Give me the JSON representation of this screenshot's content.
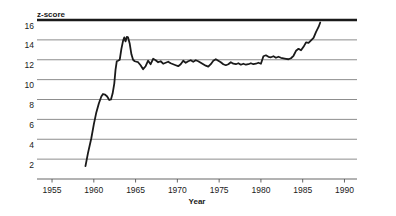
{
  "chart_data": {
    "type": "line",
    "title": "",
    "xlabel": "Year",
    "ylabel": "z-score",
    "xlim": [
      1953.2,
      1991.5
    ],
    "ylim": [
      0,
      16
    ],
    "xticks": [
      1955,
      1960,
      1965,
      1970,
      1975,
      1980,
      1985,
      1990
    ],
    "xtick_labels": [
      "1955",
      "1960",
      "1965",
      "1970",
      "1975",
      "1980",
      "1985",
      "1990"
    ],
    "yticks": [
      2,
      4,
      6,
      8,
      10,
      12,
      14,
      16
    ],
    "ytick_labels": [
      "2",
      "4",
      "6",
      "8",
      "10",
      "12",
      "14",
      "16"
    ],
    "grid": "horizontal",
    "grid_color": "#808080",
    "top_border_color": "#1a1a1a",
    "line_color": "#1a1a1a",
    "line_width": 1.8,
    "series": [
      {
        "name": "z-score",
        "x": [
          1959.0,
          1959.3,
          1959.7,
          1960.0,
          1960.3,
          1960.6,
          1960.9,
          1961.1,
          1961.35,
          1961.6,
          1961.85,
          1962.05,
          1962.25,
          1962.45,
          1962.6,
          1962.75,
          1962.9,
          1963.1,
          1963.3,
          1963.5,
          1963.65,
          1963.8,
          1963.95,
          1964.1,
          1964.3,
          1964.5,
          1964.7,
          1964.9,
          1965.1,
          1965.3,
          1965.6,
          1965.9,
          1966.2,
          1966.5,
          1966.8,
          1967.1,
          1967.4,
          1967.7,
          1968.0,
          1968.3,
          1968.6,
          1968.9,
          1969.2,
          1969.5,
          1969.8,
          1970.1,
          1970.4,
          1970.7,
          1971.0,
          1971.3,
          1971.6,
          1971.9,
          1972.2,
          1972.5,
          1972.8,
          1973.1,
          1973.4,
          1973.7,
          1974.0,
          1974.3,
          1974.6,
          1974.9,
          1975.2,
          1975.5,
          1975.8,
          1976.1,
          1976.4,
          1976.7,
          1977.0,
          1977.3,
          1977.6,
          1977.9,
          1978.2,
          1978.5,
          1978.8,
          1979.1,
          1979.4,
          1979.7,
          1980.0,
          1980.3,
          1980.6,
          1980.9,
          1981.2,
          1981.5,
          1981.8,
          1982.1,
          1982.4,
          1982.7,
          1983.0,
          1983.3,
          1983.6,
          1983.9,
          1984.2,
          1984.5,
          1984.8,
          1985.1,
          1985.4,
          1985.7,
          1986.0,
          1986.3,
          1986.6,
          1986.9,
          1987.1
        ],
        "y": [
          1.3,
          2.6,
          4.1,
          5.5,
          6.7,
          7.6,
          8.3,
          8.55,
          8.5,
          8.3,
          7.95,
          8.0,
          8.6,
          9.6,
          11.0,
          11.85,
          11.9,
          12.0,
          13.1,
          13.9,
          14.25,
          13.85,
          14.3,
          14.25,
          13.6,
          12.55,
          12.0,
          11.85,
          11.8,
          11.75,
          11.45,
          11.05,
          11.35,
          11.9,
          11.55,
          12.1,
          11.95,
          11.75,
          11.85,
          11.6,
          11.7,
          11.8,
          11.65,
          11.55,
          11.45,
          11.35,
          11.55,
          11.9,
          11.7,
          11.85,
          11.95,
          11.8,
          11.95,
          11.85,
          11.7,
          11.55,
          11.4,
          11.3,
          11.55,
          11.9,
          12.05,
          11.9,
          11.75,
          11.55,
          11.45,
          11.55,
          11.75,
          11.6,
          11.55,
          11.65,
          11.5,
          11.6,
          11.5,
          11.55,
          11.65,
          11.55,
          11.6,
          11.7,
          11.6,
          12.35,
          12.45,
          12.3,
          12.25,
          12.35,
          12.2,
          12.3,
          12.2,
          12.15,
          12.1,
          12.05,
          12.15,
          12.4,
          12.9,
          13.1,
          12.95,
          13.3,
          13.75,
          13.7,
          13.95,
          14.2,
          14.8,
          15.3,
          15.75
        ]
      }
    ]
  },
  "labels": {
    "y_axis_title": "z-score",
    "x_axis_title": "Year"
  }
}
